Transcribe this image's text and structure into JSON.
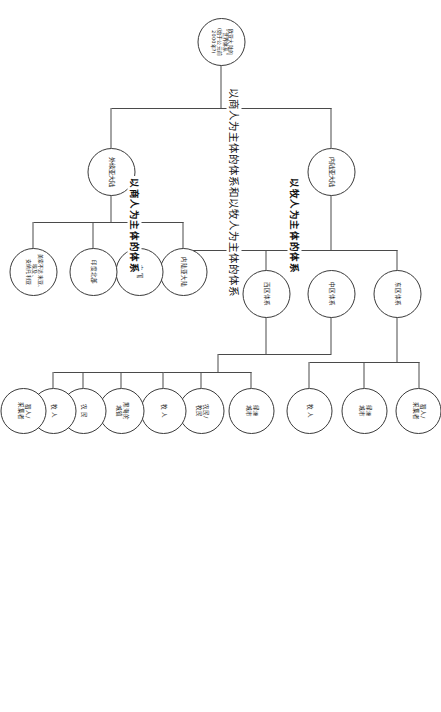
{
  "diagram": {
    "title": "以商人为主体的体系和以牧人为主体的体系",
    "orientation_note": "rotated-90",
    "branch_labels": {
      "herders": "以牧人为主体的体系",
      "merchants": "以商人为主体的体系"
    },
    "root": {
      "label": "欧亚大陆的\n“世界体系”\n(始于公元前\n2000年?)"
    },
    "level1": [
      {
        "id": "inner-eurasia",
        "label": "内陆亚大陆"
      },
      {
        "id": "outer-eurasia",
        "label": "外缘亚大陆"
      }
    ],
    "level2_herders": [
      {
        "id": "east-zone",
        "label": "东区体系"
      },
      {
        "id": "central-zone",
        "label": "中区体系"
      },
      {
        "id": "west-zone",
        "label": "西区体系"
      }
    ],
    "level2_merchants": [
      {
        "id": "inner-asia",
        "label": "内陆亚大陆"
      },
      {
        "id": "china",
        "label": "中 国"
      },
      {
        "id": "north-india",
        "label": "印度北部"
      },
      {
        "id": "mesopotamia",
        "label": "美索不达米亚、\n埃及、\n安纳托利亚"
      }
    ],
    "level3_east": [
      {
        "id": "east-farmers",
        "label": "猎人/\n采集者"
      },
      {
        "id": "east-oasis",
        "label": "绿洲\n城市"
      },
      {
        "id": "east-herders",
        "label": "牧 人"
      }
    ],
    "level3_central": [
      {
        "id": "central-oasis",
        "label": "绿洲\n城市"
      },
      {
        "id": "central-farmer-herder",
        "label": "农民/\n牧民"
      },
      {
        "id": "central-herders",
        "label": "牧 人"
      }
    ],
    "level3_west": [
      {
        "id": "west-blacksea",
        "label": "黑海的\n城镇"
      },
      {
        "id": "west-farmers",
        "label": "农 民"
      },
      {
        "id": "west-herders",
        "label": "牧 人"
      },
      {
        "id": "west-hunters",
        "label": "猎人/\n采集者"
      }
    ],
    "colors": {
      "stroke": "#3a3a3a",
      "line": "#4a4a4a",
      "text": "#1a1a1a",
      "background": "#ffffff"
    }
  }
}
